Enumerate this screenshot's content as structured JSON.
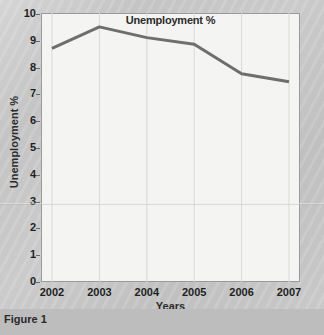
{
  "figure": {
    "caption": "Figure 1"
  },
  "chart_data": {
    "type": "line",
    "title": "Unemployment %",
    "xlabel": "Years",
    "ylabel": "Unemployment %",
    "categories": [
      "2002",
      "2003",
      "2004",
      "2005",
      "2006",
      "2007"
    ],
    "x": [
      2002,
      2003,
      2004,
      2005,
      2006,
      2007
    ],
    "values": [
      8.7,
      9.5,
      9.1,
      8.85,
      7.75,
      7.45
    ],
    "series": [
      {
        "name": "Unemployment %",
        "values": [
          8.7,
          9.5,
          9.1,
          8.85,
          7.75,
          7.45
        ],
        "color": "#6e6e6e"
      }
    ],
    "ylim": [
      0,
      10
    ],
    "yticks": [
      0,
      1,
      2,
      3,
      4,
      5,
      6,
      7,
      8,
      9,
      10
    ],
    "ytick_labels": [
      "0",
      "1",
      "2",
      "3",
      "4",
      "5",
      "6",
      "7",
      "8",
      "9",
      "10"
    ],
    "xlim": [
      2002,
      2007
    ],
    "grid": true,
    "grid_axis": "x",
    "legend": false,
    "markers": false,
    "line_width": 3,
    "plot_background": "#f4f4f2",
    "grid_color": "#d8d8d8",
    "axis_color": "#9a9a9a"
  }
}
